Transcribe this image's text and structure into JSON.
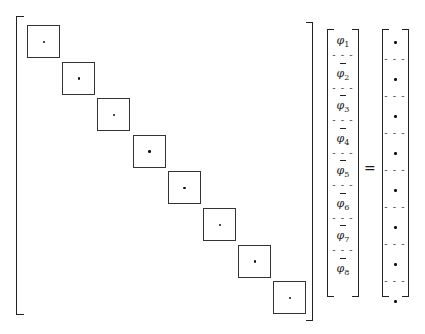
{
  "figure": {
    "matrix": {
      "block_count": 8,
      "block_entry_symbol": "•"
    },
    "vector_left": {
      "entries": [
        {
          "symbol": "φ",
          "index": "1",
          "overbar": false
        },
        {
          "symbol": "φ",
          "index": "2",
          "overbar": true
        },
        {
          "symbol": "φ",
          "index": "3",
          "overbar": true
        },
        {
          "symbol": "φ",
          "index": "4",
          "overbar": true
        },
        {
          "symbol": "φ",
          "index": "5",
          "overbar": true
        },
        {
          "symbol": "φ",
          "index": "6",
          "overbar": true
        },
        {
          "symbol": "φ",
          "index": "7",
          "overbar": true
        },
        {
          "symbol": "φ",
          "index": "8",
          "overbar": true
        }
      ],
      "separator": "- - -"
    },
    "equals_sign": "=",
    "vector_right": {
      "entry_count": 8,
      "entry_symbol": "•",
      "separator": "- - -"
    }
  }
}
